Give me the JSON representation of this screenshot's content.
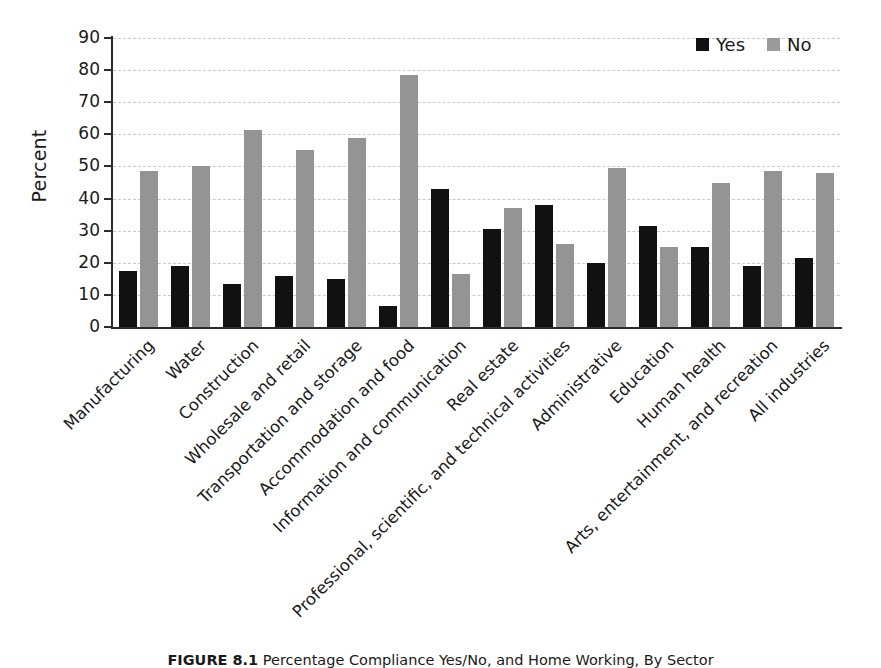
{
  "chart_data": {
    "type": "bar",
    "title": "",
    "xlabel": "",
    "ylabel": "Percent",
    "ylim": [
      0,
      90
    ],
    "yticks": [
      0,
      10,
      20,
      30,
      40,
      50,
      60,
      70,
      80,
      90
    ],
    "grid": true,
    "legend_position": "top-right",
    "categories": [
      "Manufacturing",
      "Water",
      "Construction",
      "Wholesale and retail",
      "Transportation and storage",
      "Accommodation and food",
      "Information and communication",
      "Real estate",
      "Professional, scientific, and technical activities",
      "Administrative",
      "Education",
      "Human health",
      "Arts, entertainment, and recreation",
      "All industries"
    ],
    "series": [
      {
        "name": "Yes",
        "color": "#111111",
        "values": [
          17.5,
          19,
          13.5,
          16,
          15,
          6.5,
          43,
          30.5,
          38,
          20,
          31.5,
          25,
          19,
          21.5
        ]
      },
      {
        "name": "No",
        "color": "#949494",
        "values": [
          48.5,
          50,
          61.5,
          55,
          59,
          78.5,
          16.5,
          37,
          26,
          49.5,
          25,
          45,
          48.5,
          48
        ]
      }
    ]
  },
  "legend": {
    "items": [
      {
        "label": "Yes",
        "color": "#111111"
      },
      {
        "label": "No",
        "color": "#949494"
      }
    ]
  },
  "caption": {
    "figure_number": "FIGURE 8.1",
    "text": "Percentage Compliance Yes/No, and Home Working, By Sector"
  }
}
